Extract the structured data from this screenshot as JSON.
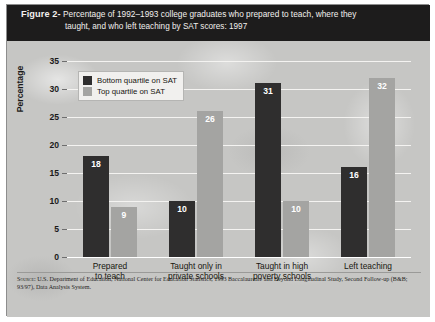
{
  "figure": {
    "label": "Figure 2-",
    "caption_line1": "Percentage of 1992–1993 college graduates who prepared to teach, where they",
    "caption_line2": "taught, and who left teaching by SAT scores: 1997"
  },
  "source": {
    "prefix": "Source:",
    "text": " U.S. Department of Education, National Center for Education Statistics, 1993 Baccalaureate and Beyond Longitudinal Study, Second Follow-up (B&B; 93/97), Data Analysis System."
  },
  "colors": {
    "bottom_quartile": "#2f2e2e",
    "top_quartile": "#a4a4a2",
    "caption_band": "#1d1c1c",
    "paper": "#c6c6c4",
    "gridline": "#f4f3f1"
  },
  "chart_data": {
    "type": "bar",
    "title": "Percentage of 1992–1993 college graduates who prepared to teach, where they taught, and who left teaching by SAT scores: 1997",
    "xlabel": "",
    "ylabel": "Percentage",
    "ylim": [
      0,
      35
    ],
    "yticks": [
      0,
      5,
      10,
      15,
      20,
      25,
      30,
      35
    ],
    "ytick_labels": [
      "0",
      "5",
      "10",
      "15",
      "20",
      "25",
      "30",
      "35"
    ],
    "grid": true,
    "legend_position": "upper-left-inside",
    "categories": [
      "Prepared to teach",
      "Taught only in private schools",
      "Taught in high poverty schools",
      "Left teaching"
    ],
    "category_lines": [
      [
        "Prepared",
        "to teach"
      ],
      [
        "Taught only in",
        "private schools"
      ],
      [
        "Taught in high",
        "poverty schools"
      ],
      [
        "Left teaching"
      ]
    ],
    "series": [
      {
        "name": "Bottom quartile on SAT",
        "color": "#2f2e2e",
        "values": [
          18,
          10,
          31,
          16
        ]
      },
      {
        "name": "Top quartile on SAT",
        "color": "#a4a4a2",
        "values": [
          9,
          26,
          10,
          32
        ]
      }
    ]
  }
}
